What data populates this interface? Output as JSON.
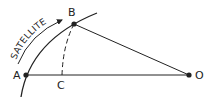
{
  "diagram": {
    "colors": {
      "ink": "#222222",
      "background": "#ffffff"
    },
    "points": {
      "A": {
        "label": "A",
        "x": 26,
        "y": 75
      },
      "B": {
        "label": "B",
        "x": 74,
        "y": 24
      },
      "C": {
        "label": "C",
        "x": 62,
        "y": 75
      },
      "O": {
        "label": "O",
        "x": 189,
        "y": 75
      }
    },
    "orbit_label": "SATELLITE",
    "labels": {
      "A": "A",
      "B": "B",
      "C": "C",
      "O": "O",
      "satellite": "SATELLITE"
    }
  }
}
